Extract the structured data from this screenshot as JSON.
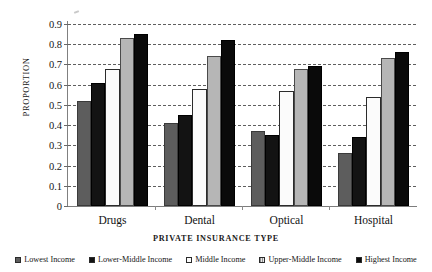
{
  "chart_data": {
    "type": "bar",
    "title": "",
    "xlabel": "PRIVATE INSURANCE TYPE",
    "ylabel": "PROPORTION",
    "categories": [
      "Drugs",
      "Dental",
      "Optical",
      "Hospital"
    ],
    "ylim": [
      0,
      0.9
    ],
    "ytick_labels": [
      "0",
      "0.1",
      "0.2",
      "0.3",
      "0.4",
      "0.5",
      "0.6",
      "0.7",
      "0.8",
      "0.9"
    ],
    "ytick_values": [
      0,
      0.1,
      0.2,
      0.3,
      0.4,
      0.5,
      0.6,
      0.7,
      0.8,
      0.9
    ],
    "grid": "horizontal-dashed",
    "legend_position": "bottom",
    "series": [
      {
        "name": "Lowest Income",
        "color": "#5d5d5d",
        "values": [
          0.52,
          0.41,
          0.37,
          0.26
        ]
      },
      {
        "name": "Lower-Middle Income",
        "color": "#131313",
        "values": [
          0.61,
          0.45,
          0.35,
          0.34
        ]
      },
      {
        "name": "Middle Income",
        "color": "#fbfbfb",
        "values": [
          0.68,
          0.58,
          0.57,
          0.54
        ]
      },
      {
        "name": "Upper-Middle Income",
        "color": "#b6b6b6",
        "values": [
          0.83,
          0.74,
          0.68,
          0.73
        ]
      },
      {
        "name": "Highest Income",
        "color": "#0a0a0a",
        "values": [
          0.85,
          0.82,
          0.69,
          0.76
        ]
      }
    ]
  }
}
